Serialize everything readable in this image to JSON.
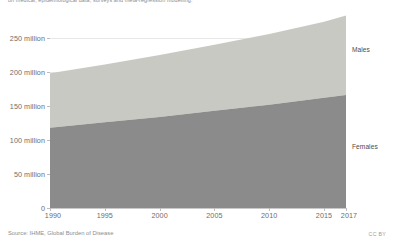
{
  "subtitle": "on medical, epidemiological data, surveys and meta-regression modelling.",
  "source": "Source: IHME, Global Burden of Disease",
  "license": "CC BY",
  "series_labels": {
    "males": "Males",
    "females": "Females"
  },
  "colors": {
    "males": "#c9c9c4",
    "females": "#8b8b8b",
    "grid": "#e8e8e8",
    "axis": "#bdbdbd",
    "text": "#6d6d6d"
  },
  "chart_data": {
    "type": "area",
    "stacked": true,
    "title": "",
    "subtitle": "on medical, epidemiological data, surveys and meta-regression modelling.",
    "xlabel": "",
    "ylabel": "",
    "xlim": [
      1990,
      2017
    ],
    "ylim": [
      0,
      265
    ],
    "grid": true,
    "legend_position": "inline-right",
    "x": [
      1990,
      1995,
      2000,
      2005,
      2010,
      2015,
      2017
    ],
    "xtick_labels": [
      "1990",
      "1995",
      "2000",
      "2005",
      "2010",
      "2015",
      "2017"
    ],
    "ytick_values": [
      0,
      50,
      100,
      150,
      200,
      250
    ],
    "ytick_labels": [
      "0",
      "50 million",
      "100 million",
      "150 million",
      "200 million",
      "250 million"
    ],
    "series": [
      {
        "name": "Females",
        "color": "#8b8b8b",
        "values": [
          118,
          126,
          134,
          143,
          152,
          162,
          166
        ]
      },
      {
        "name": "Males",
        "color": "#c9c9c4",
        "values": [
          80,
          85,
          91,
          97,
          104,
          112,
          117
        ]
      }
    ],
    "totals": [
      198,
      211,
      225,
      240,
      256,
      274,
      283
    ],
    "units": "people"
  }
}
